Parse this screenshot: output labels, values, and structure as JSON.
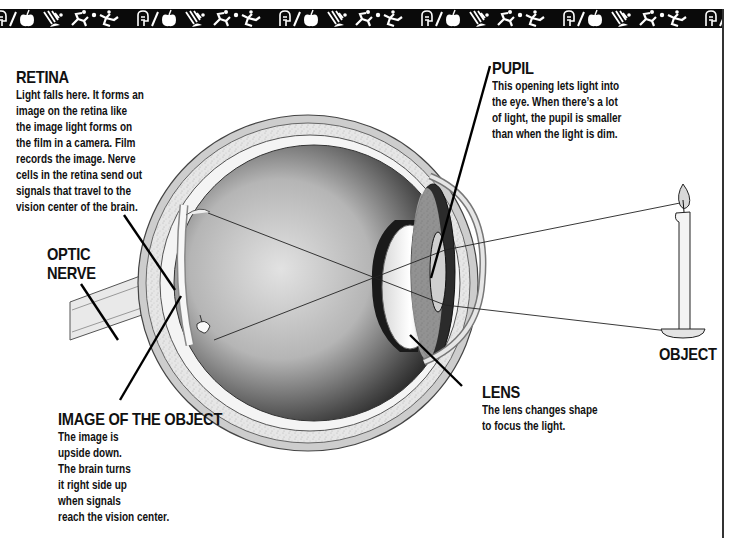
{
  "banner": {
    "pattern_icons": [
      "stick-figure-running-icon",
      "apple-icon",
      "head-profile-icon",
      "hand-icon",
      "ball-icon"
    ],
    "background": "#0a0a0a",
    "foreground": "#ffffff"
  },
  "labels": {
    "retina": {
      "title": "RETINA",
      "lines": [
        "Light falls here.  It forms an",
        "image on the retina like",
        "the image light forms on",
        "the film in a camera.  Film",
        "records the image.  Nerve",
        "cells in the retina send out",
        "signals that travel to the",
        "vision center of the brain."
      ]
    },
    "pupil": {
      "title": "PUPIL",
      "lines": [
        "This opening lets light into",
        "the eye.  When there’s a lot",
        "of light, the pupil is smaller",
        "than when the light is dim."
      ]
    },
    "optic_nerve": {
      "title_lines": [
        "OPTIC",
        "NERVE"
      ]
    },
    "object": {
      "title": "OBJECT"
    },
    "lens": {
      "title": "LENS",
      "lines": [
        "The lens changes shape",
        "to focus the light."
      ]
    },
    "image_of_object": {
      "title": "IMAGE OF THE OBJECT",
      "lines": [
        "The image is",
        "upside down.",
        "The brain turns",
        "it right side up",
        "when signals",
        "reach the vision center."
      ]
    }
  },
  "colors": {
    "ink": "#111111",
    "sclera_outer": "#c8c8c8",
    "sclera_speckle": "#e4e4e4",
    "vitreous_dark": "#3a3a3a",
    "vitreous_light": "#d8d8d8",
    "iris": "#2a2a2a",
    "candle_flame": "#d0d0d0"
  }
}
